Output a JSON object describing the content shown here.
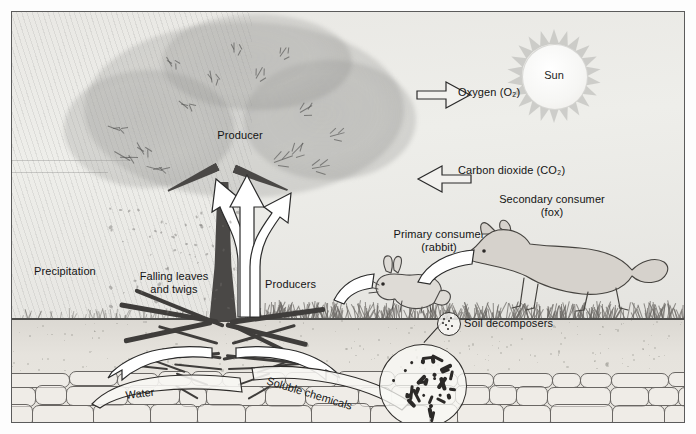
{
  "diagram": {
    "frame_color": "#5b5b5b",
    "background_color": "#eceae6"
  },
  "sky": {
    "sun": {
      "label": "Sun",
      "ray_count": 22,
      "color": "#f6f6f4"
    }
  },
  "labels": {
    "sun": "Sun",
    "oxygen": "Oxygen (O₂)",
    "carbon_dioxide": "Carbon dioxide (CO₂)",
    "producer": "Producer",
    "producers": "Producers",
    "precipitation": "Precipitation",
    "falling_leaves": "Falling leaves\nand twigs",
    "primary_consumer": "Primary consumer\n(rabbit)",
    "secondary_consumer": "Secondary consumer\n(fox)",
    "soil_decomposers": "Soil decomposers",
    "water": "Water",
    "soluble_chemicals": "Soluble chemicals"
  },
  "arrows": {
    "oxygen": {
      "name": "oxygen-arrow",
      "direction": "right"
    },
    "carbon_dioxide": {
      "name": "carbon-dioxide-arrow",
      "direction": "left"
    },
    "grass_to_rabbit": {
      "name": "grass-to-rabbit-arrow",
      "direction": "right"
    },
    "rabbit_to_fox": {
      "name": "rabbit-to-fox-arrow",
      "direction": "right"
    },
    "trunk_up_left": {
      "name": "trunk-flow-arrow-left",
      "direction": "up"
    },
    "trunk_up_center": {
      "name": "trunk-flow-arrow-center",
      "direction": "up"
    },
    "trunk_up_right": {
      "name": "trunk-flow-arrow-right",
      "direction": "up"
    },
    "water_uptake": {
      "name": "water-uptake-arrow",
      "direction": "up-right"
    },
    "chemical_uptake": {
      "name": "soluble-chemical-uptake-arrow",
      "direction": "up-left"
    }
  },
  "organisms": {
    "tree": {
      "role": "producer"
    },
    "grass": {
      "role": "producers"
    },
    "rabbit": {
      "role": "primary consumer"
    },
    "fox": {
      "role": "secondary consumer"
    },
    "bacteria": {
      "role": "soil decomposers",
      "count": 34
    }
  },
  "layers": {
    "sky": "sky",
    "soil": "soil",
    "bedrock": "bedrock"
  }
}
